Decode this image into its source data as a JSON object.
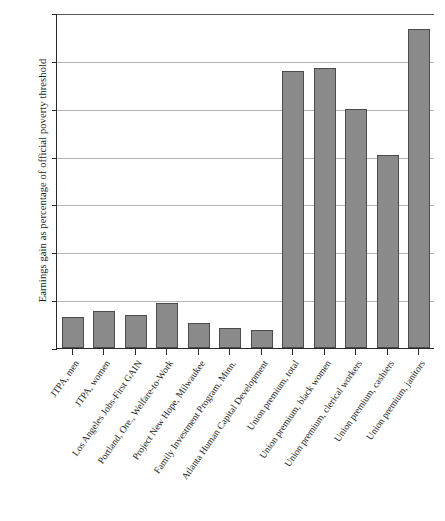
{
  "chart_data": {
    "type": "bar",
    "title": "",
    "xlabel": "",
    "ylabel": "Earnings gain as percentage of official poverty threshold",
    "ylim": [
      0,
      70
    ],
    "yticks": [
      0,
      10,
      20,
      30,
      40,
      50,
      60,
      70
    ],
    "grid": true,
    "legend": "none",
    "bar_color": "#8a8a8a",
    "bar_edge_color": "#4b4b4b",
    "categories": [
      "JTPA, men",
      "JTPA, women",
      "Los Angeles Jobs-First GAIN",
      "Portland, Ore., Welfare-to-Work",
      "Project New Hope, Milwaukee",
      "Family Investment Program, Minn.",
      "Atlanta Human Capital Development",
      "Union premium, total",
      "Union premium, black women",
      "Union premium, clerical workers",
      "Union premium, cashiers",
      "Union premium, janitors"
    ],
    "values": [
      6.5,
      7.7,
      6.8,
      9.4,
      5.2,
      4.2,
      3.8,
      57.9,
      58.6,
      50.0,
      40.4,
      66.7
    ]
  }
}
